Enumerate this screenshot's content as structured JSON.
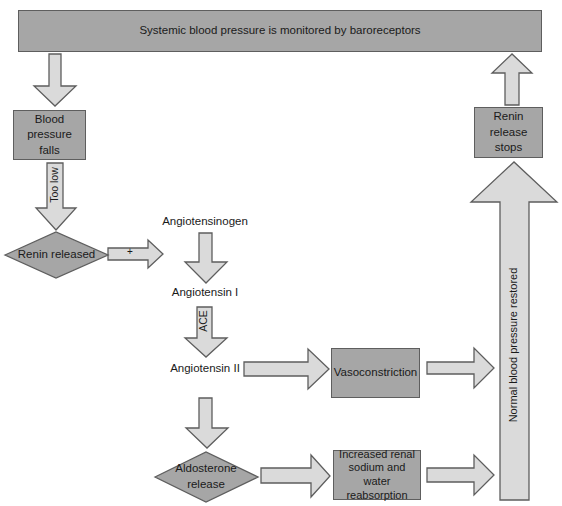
{
  "diagram": {
    "title_bar": "Systemic blood pressure is monitored by baroreceptors",
    "nodes": {
      "bp_falls": "Blood pressure falls",
      "renin_released": "Renin released",
      "angiotensinogen": "Angiotensinogen",
      "angiotensin_1": "Angiotensin I",
      "angiotensin_2": "Angiotensin II",
      "vasoconstriction": "Vasoconstriction",
      "aldosterone": "Aldosterone release",
      "renal_reabsorption": "Increased renal sodium and water reabsorption",
      "renin_stops": "Renin release stops"
    },
    "arrow_labels": {
      "too_low": "Too low",
      "plus": "+",
      "ace": "ACE",
      "normal_restored": "Normal blood pressure restored"
    },
    "colors": {
      "box_fill": "#a6a6a6",
      "arrow_fill": "#dadada",
      "stroke": "#5e5e5e"
    }
  }
}
